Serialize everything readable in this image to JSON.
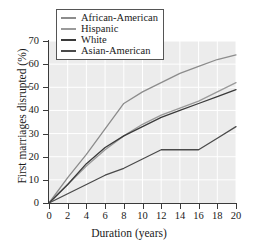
{
  "chart_data": {
    "type": "line",
    "title": "",
    "xlabel": "Duration (years)",
    "ylabel": "First marriages disrupted (%)",
    "xlim": [
      0,
      20
    ],
    "ylim": [
      0,
      70
    ],
    "xticks": [
      0,
      2,
      4,
      6,
      8,
      10,
      12,
      14,
      16,
      18,
      20
    ],
    "yticks": [
      0,
      10,
      20,
      30,
      40,
      50,
      60,
      70
    ],
    "grid": true,
    "legend_position": "top-left",
    "x": [
      0,
      2,
      4,
      6,
      8,
      10,
      12,
      14,
      16,
      18,
      20
    ],
    "series": [
      {
        "name": "African-American",
        "color": "#8c8c8c",
        "values": [
          0,
          11,
          21,
          32,
          43,
          48,
          52,
          56,
          59,
          62,
          64
        ]
      },
      {
        "name": "Hispanic",
        "color": "#9a9a9a",
        "values": [
          0,
          8,
          16,
          23,
          29,
          34,
          38,
          41,
          44,
          48,
          52
        ]
      },
      {
        "name": "White",
        "color": "#3a3a3a",
        "values": [
          0,
          8,
          17,
          24,
          29,
          33,
          37,
          40,
          43,
          46,
          49
        ]
      },
      {
        "name": "Asian-American",
        "color": "#4a4a4a",
        "values": [
          0,
          4,
          8,
          12,
          15,
          19,
          23,
          23,
          23,
          28,
          33
        ]
      }
    ]
  },
  "legend": {
    "entries": [
      {
        "label": "African-American",
        "color": "#8c8c8c"
      },
      {
        "label": "Hispanic",
        "color": "#9a9a9a"
      },
      {
        "label": "White",
        "color": "#3a3a3a"
      },
      {
        "label": "Asian-American",
        "color": "#4a4a4a"
      }
    ]
  },
  "axes": {
    "x_title": "Duration (years)",
    "y_title": "First marriages disrupted (%)",
    "x_tick_labels": [
      "0",
      "2",
      "4",
      "6",
      "8",
      "10",
      "12",
      "14",
      "16",
      "18",
      "20"
    ],
    "y_tick_labels": [
      "0",
      "10",
      "20",
      "30",
      "40",
      "50",
      "60",
      "70"
    ]
  },
  "style": {
    "plot_background": "#ececec",
    "grid_color": "#ffffff",
    "axis_color": "#3a3a3a",
    "figure_background": "#ffffff"
  }
}
